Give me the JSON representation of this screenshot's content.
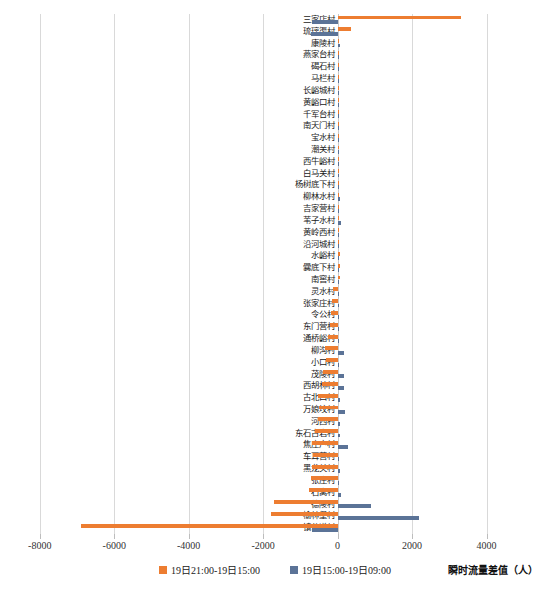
{
  "chart_data": {
    "type": "bar",
    "orientation": "horizontal",
    "title": "",
    "xlabel": "瞬时流量差值（人）",
    "ylabel": "",
    "xlim": [
      -8800,
      4900
    ],
    "xticks": [
      -8000,
      -6000,
      -4000,
      -2000,
      0,
      2000,
      4000
    ],
    "xticklabels": [
      "-8000",
      "-6000",
      "-4000",
      "-2000",
      "0",
      "2000",
      "4000"
    ],
    "grid": true,
    "legend_position": "bottom-center",
    "colors": {
      "series0": "#ED7D31",
      "series1": "#5B7397"
    },
    "categories": [
      "三家店村",
      "琉璃渠村",
      "康陵村",
      "燕家台村",
      "碣石村",
      "马栏村",
      "长峪城村",
      "黄峪口村",
      "千军台村",
      "南天门村",
      "宝水村",
      "潮关村",
      "西牛峪村",
      "白马关村",
      "杨树底下村",
      "柳林水村",
      "吉家营村",
      "苇子水村",
      "黄岭西村",
      "沿河城村",
      "水峪村",
      "爨底下村",
      "南窖村",
      "灵水村",
      "张家庄村",
      "令公村",
      "东门营村",
      "通桥峪村",
      "柳沟村",
      "小口村",
      "茂陵村",
      "西胡林村",
      "古北口村",
      "万娘坟村",
      "河西村",
      "东石古岩村",
      "焦庄户村",
      "车耳营村",
      "黑龙关村",
      "张庄村",
      "石窝村",
      "德陵村",
      "榆林堡村",
      "镇岔道村"
    ],
    "series": [
      {
        "name": "19日21:00-19日15:00",
        "color": "#ED7D31",
        "values": [
          3320,
          370,
          40,
          15,
          12,
          10,
          10,
          8,
          8,
          8,
          10,
          12,
          14,
          20,
          22,
          25,
          30,
          35,
          45,
          50,
          55,
          60,
          70,
          -120,
          -160,
          -180,
          -200,
          -250,
          -330,
          -320,
          -400,
          -420,
          -520,
          -500,
          -530,
          -610,
          -700,
          -660,
          -700,
          -720,
          -760,
          -1700,
          -1800,
          -6900
        ]
      },
      {
        "name": "19日15:00-19日09:00",
        "color": "#5B7397",
        "values": [
          -700,
          -710,
          60,
          5,
          4,
          4,
          4,
          3,
          3,
          3,
          4,
          5,
          5,
          8,
          40,
          75,
          10,
          80,
          12,
          12,
          14,
          35,
          14,
          15,
          18,
          20,
          22,
          25,
          170,
          35,
          175,
          180,
          60,
          190,
          60,
          65,
          290,
          30,
          70,
          40,
          95,
          900,
          2200,
          -700
        ]
      }
    ]
  },
  "legend": {
    "items": [
      {
        "label": "19日21:00-19日15:00",
        "color": "#ED7D31"
      },
      {
        "label": "19日15:00-19日09:00",
        "color": "#5B7397"
      }
    ]
  },
  "axis": {
    "x_title": "瞬时流量差值（人）"
  },
  "caption": {
    "text": ""
  }
}
